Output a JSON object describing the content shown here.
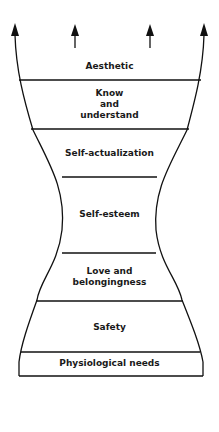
{
  "diagram": {
    "levels": [
      {
        "label": "Aesthetic",
        "lines": [
          "Aesthetic"
        ]
      },
      {
        "label": "Know and understand",
        "lines": [
          "Know",
          "and",
          "understand"
        ]
      },
      {
        "label": "Self-actualization",
        "lines": [
          "Self-actualization"
        ]
      },
      {
        "label": "Self-esteem",
        "lines": [
          "Self-esteem"
        ]
      },
      {
        "label": "Love and belongingness",
        "lines": [
          "Love and",
          "belongingness"
        ]
      },
      {
        "label": "Safety",
        "lines": [
          "Safety"
        ]
      },
      {
        "label": "Physiological needs",
        "lines": [
          "Physiological needs"
        ]
      }
    ],
    "arrows": 4,
    "colors": {
      "line": "#111111",
      "background": "#ffffff"
    }
  }
}
